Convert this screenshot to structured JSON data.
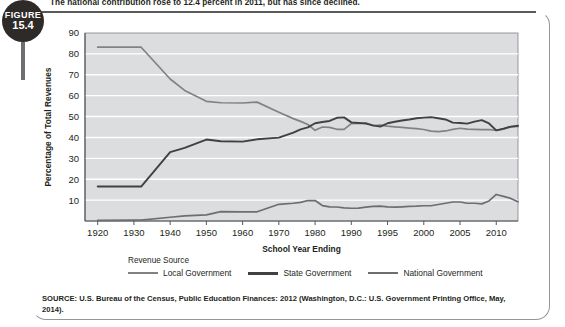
{
  "figure": {
    "badge_label": "FIGURE",
    "badge_number": "15.4",
    "caption": "The national contribution rose to 12.4 percent in 2011, but has since declined."
  },
  "source": {
    "text": "SOURCE: U.S. Bureau of the Census, Public Education Finances: 2012 (Washington, D.C.: U.S. Government Printing Office, May, 2014)."
  },
  "legend": {
    "title": "Revenue Source",
    "items": [
      {
        "label": "Local Government",
        "color": "#808285"
      },
      {
        "label": "State Government",
        "color": "#414042"
      },
      {
        "label": "National Government",
        "color": "#6d6e71"
      }
    ]
  },
  "chart_data": {
    "type": "line",
    "title": "",
    "xlabel": "School Year Ending",
    "ylabel": "Percentage of Total Revenues",
    "ylim": [
      0,
      90
    ],
    "yticks": [
      10,
      20,
      30,
      40,
      50,
      60,
      70,
      80,
      90
    ],
    "grid": true,
    "legend_position": "bottom",
    "plot_bg": "#dcdddf",
    "xticks": [
      "1920",
      "1930",
      "1940",
      "1950",
      "1960",
      "1970",
      "1980",
      "1990",
      "1995",
      "2000",
      "2005",
      "2010"
    ],
    "x_positions": [
      1920,
      1930,
      1940,
      1950,
      1960,
      1970,
      1980,
      1990,
      1995,
      2000,
      2005,
      2010
    ],
    "x": [
      1920,
      1930,
      1932,
      1940,
      1944,
      1950,
      1954,
      1960,
      1964,
      1970,
      1974,
      1976,
      1978,
      1980,
      1982,
      1984,
      1986,
      1988,
      1990,
      1991,
      1992,
      1993,
      1994,
      1995,
      1996,
      1997,
      1998,
      1999,
      2000,
      2001,
      2002,
      2003,
      2004,
      2005,
      2006,
      2007,
      2008,
      2009,
      2010,
      2011,
      2012,
      2013
    ],
    "series": [
      {
        "name": "Local Government",
        "color": "#808285",
        "values": [
          83.2,
          83.2,
          83.2,
          68.0,
          62.5,
          57.3,
          56.6,
          56.5,
          56.9,
          52.1,
          49.0,
          47.7,
          46.2,
          43.4,
          45.0,
          44.8,
          43.9,
          43.9,
          46.6,
          46.7,
          47.0,
          45.6,
          45.9,
          45.4,
          45.1,
          44.8,
          44.5,
          44.2,
          43.8,
          43.0,
          42.8,
          43.1,
          43.9,
          44.4,
          44.0,
          43.9,
          43.7,
          43.8,
          43.4,
          44.0,
          45.0,
          45.3
        ]
      },
      {
        "name": "State Government",
        "color": "#414042",
        "values": [
          16.5,
          16.5,
          16.5,
          33.0,
          35.0,
          39.0,
          38.2,
          38.0,
          39.1,
          39.9,
          42.3,
          43.9,
          44.8,
          46.8,
          47.4,
          47.9,
          49.4,
          49.6,
          47.2,
          46.9,
          46.6,
          45.8,
          45.2,
          46.8,
          47.5,
          48.1,
          48.6,
          49.2,
          49.5,
          49.7,
          49.2,
          48.6,
          47.1,
          46.9,
          46.6,
          47.6,
          48.3,
          46.7,
          43.4,
          44.2,
          45.2,
          45.6
        ]
      },
      {
        "name": "National Government",
        "color": "#6d6e71",
        "values": [
          0.3,
          0.4,
          0.4,
          1.8,
          2.5,
          2.9,
          4.5,
          4.4,
          4.4,
          8.0,
          8.5,
          8.9,
          9.8,
          9.8,
          7.4,
          6.8,
          6.7,
          6.3,
          6.1,
          6.2,
          6.6,
          7.0,
          7.1,
          6.8,
          6.6,
          6.8,
          7.0,
          7.1,
          7.3,
          7.3,
          7.9,
          8.5,
          9.1,
          9.1,
          8.5,
          8.5,
          8.2,
          9.6,
          12.7,
          11.8,
          10.8,
          9.2
        ]
      }
    ]
  }
}
